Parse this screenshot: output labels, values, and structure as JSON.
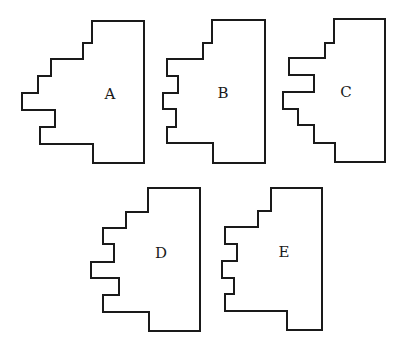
{
  "figure": {
    "stroke_color": "#1a1a1a",
    "background": "#ffffff"
  },
  "shapes": [
    {
      "label": "A",
      "points": "92,21 144,21 144,163 93,163 93,144 40,144 40,127 55,127 55,110 22,110 22,93 38,93 38,76 51,76 51,59 83,59 83,43 92,43",
      "label_x": 110,
      "label_y": 99
    },
    {
      "label": "B",
      "points": "212,20 265,20 265,163 213,163 213,143 167,143 167,127 176,127 176,109 163,109 163,93 178,93 178,76 167,76 167,59 203,59 203,43 212,43",
      "label_x": 223,
      "label_y": 98
    },
    {
      "label": "C",
      "points": "334,19 385,19 385,162 335,162 335,143 314,143 314,125 298,125 298,109 283,109 283,92 314,92 314,75 289,75 289,58 325,58 325,43 334,43",
      "label_x": 346,
      "label_y": 97
    },
    {
      "label": "D",
      "points": "148,188 200,188 200,331 149,331 149,312 103,312 103,295 119,295 119,278 91,278 91,262 114,262 114,244 103,244 103,228 126,228 126,212 148,212",
      "label_x": 161,
      "label_y": 258
    },
    {
      "label": "E",
      "points": "271,188 322,188 322,330 287,330 287,311 225,311 225,294 234,294 234,278 222,278 222,261 237,261 237,244 225,244 225,227 258,227 258,211 271,211",
      "label_x": 284,
      "label_y": 257
    }
  ]
}
